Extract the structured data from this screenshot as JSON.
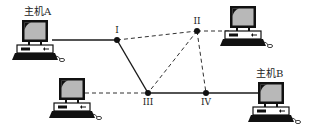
{
  "hosts": {
    "a": {
      "label": "主机A"
    },
    "b": {
      "label": "主机B"
    }
  },
  "routers": [
    {
      "id": "I",
      "label": "I"
    },
    {
      "id": "II",
      "label": "II"
    },
    {
      "id": "III",
      "label": "III"
    },
    {
      "id": "IV",
      "label": "IV"
    }
  ],
  "links": [
    {
      "from": "主机A",
      "to": "I",
      "style": "solid"
    },
    {
      "from": "I",
      "to": "II",
      "style": "dashed"
    },
    {
      "from": "I",
      "to": "III",
      "style": "solid"
    },
    {
      "from": "II",
      "to": "top-right-computer",
      "style": "dashed"
    },
    {
      "from": "II",
      "to": "III",
      "style": "dashed"
    },
    {
      "from": "II",
      "to": "IV",
      "style": "dashed"
    },
    {
      "from": "III",
      "to": "bottom-left-computer",
      "style": "dashed"
    },
    {
      "from": "III",
      "to": "IV",
      "style": "solid"
    },
    {
      "from": "IV",
      "to": "主机B",
      "style": "solid"
    }
  ],
  "colors": {
    "line": "#1a1a1a",
    "screen": "#b8b8b8",
    "body": "#111111"
  }
}
